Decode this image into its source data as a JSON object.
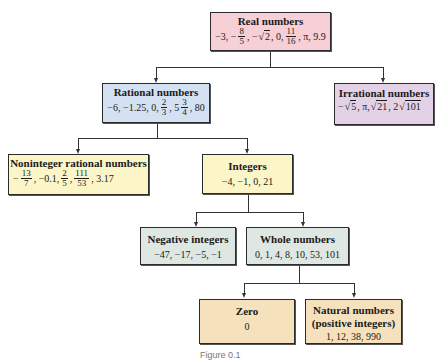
{
  "colors": {
    "real": "#f7cfd6",
    "rational": "#d3e1f3",
    "irrational": "#e3d2e6",
    "noninteger": "#fbf5c8",
    "integers": "#fbf5c8",
    "negative": "#dfe7e3",
    "whole": "#dfe7e3",
    "zero": "#f6e1bd",
    "natural": "#f6e1bd"
  },
  "nodes": {
    "real": {
      "title": "Real numbers",
      "values_parts": [
        "−3, −",
        "8",
        "5",
        ", −",
        "2",
        ", 0, ",
        "11",
        "16",
        ", π, 9.9"
      ],
      "values_text": "−3, −8/5, −√2, 0, 11/16, π, 9.9"
    },
    "rational": {
      "title": "Rational numbers",
      "values_parts": [
        "−6, −1.25, 0, ",
        "2",
        "3",
        ", 5",
        "3",
        "4",
        ", 80"
      ],
      "values_text": "−6, −1.25, 0, 2/3, 5 3/4, 80"
    },
    "irrational": {
      "title": "Irrational numbers",
      "values_parts": [
        "−",
        "5",
        ", π, ",
        "21",
        ", 2",
        "101"
      ],
      "values_text": "−√5, π, √21, 2√101"
    },
    "noninteger": {
      "title": "Noninteger rational numbers",
      "values_parts": [
        "−",
        "13",
        "7",
        ", −0.1, ",
        "2",
        "5",
        ", ",
        "111",
        "53",
        ", 3.17"
      ],
      "values_text": "−13/7, −0.1, 2/5, 111/53, 3.17"
    },
    "integers": {
      "title": "Integers",
      "values": "−4, −1, 0, 21"
    },
    "negative": {
      "title": "Negative integers",
      "values": "−47, −17, −5, −1"
    },
    "whole": {
      "title": "Whole numbers",
      "values": "0, 1, 4, 8, 10, 53, 101"
    },
    "zero": {
      "title": "Zero",
      "values": "0"
    },
    "natural": {
      "title": "Natural numbers",
      "subtitle": "(positive integers)",
      "values": "1, 12, 38, 990"
    }
  },
  "edges": [
    [
      "Real numbers",
      "Rational numbers"
    ],
    [
      "Real numbers",
      "Irrational numbers"
    ],
    [
      "Rational numbers",
      "Noninteger rational numbers"
    ],
    [
      "Rational numbers",
      "Integers"
    ],
    [
      "Integers",
      "Negative integers"
    ],
    [
      "Integers",
      "Whole numbers"
    ],
    [
      "Whole numbers",
      "Zero"
    ],
    [
      "Whole numbers",
      "Natural numbers"
    ]
  ],
  "caption": "Figure 0.1"
}
